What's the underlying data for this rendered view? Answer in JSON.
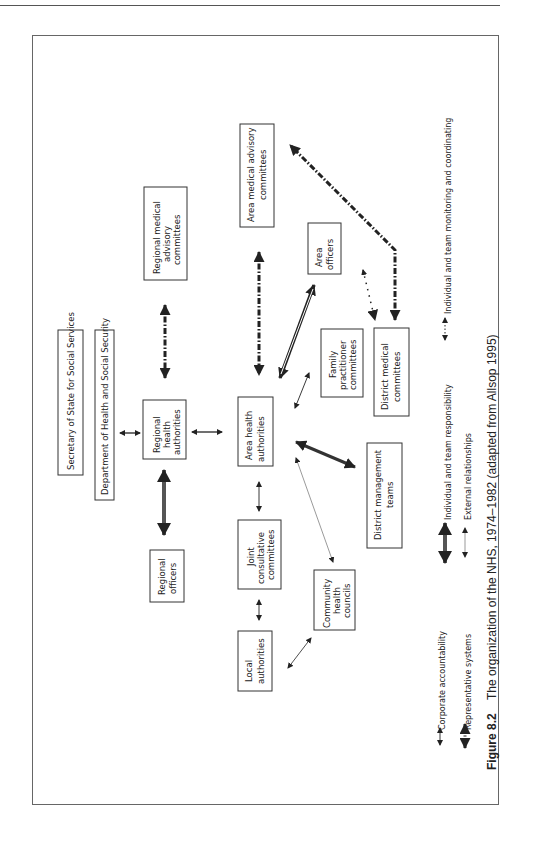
{
  "figure": {
    "number": "Figure 8.2",
    "caption": "The organization of the NHS, 1974–1982 (adapted from Allsop 1995)"
  },
  "nodes": {
    "secretary_of_state": "Secretary of State for Social Services",
    "dhss": "Department of Health and Social Security",
    "regional_health_authorities": [
      "Regional",
      "health",
      "authorities"
    ],
    "regional_medical_advisory": [
      "Regional medical",
      "advisory",
      "committees"
    ],
    "regional_officers": [
      "Regional",
      "officers"
    ],
    "area_health_authorities": [
      "Area health",
      "authorities"
    ],
    "area_medical_advisory": [
      "Area medical advisory",
      "committees"
    ],
    "area_officers": [
      "Area",
      "officers"
    ],
    "family_practitioner": [
      "Family",
      "practitioner",
      "committees"
    ],
    "district_medical": [
      "District medical",
      "committees"
    ],
    "district_management": [
      "District management",
      "teams"
    ],
    "joint_consultative": [
      "Joint",
      "consultative",
      "committees"
    ],
    "local_authorities": [
      "Local",
      "authorities"
    ],
    "community_health_councils": [
      "Community",
      "health",
      "councils"
    ]
  },
  "legend": {
    "items": [
      {
        "key": "corporate",
        "label": "Corporate accountability"
      },
      {
        "key": "representative",
        "label": "Representative systems"
      },
      {
        "key": "individual",
        "label": "Individual and team responsibility"
      },
      {
        "key": "external",
        "label": "External relationships"
      },
      {
        "key": "monitoring",
        "label": "Individual and team monitoring and coordinating"
      }
    ]
  }
}
